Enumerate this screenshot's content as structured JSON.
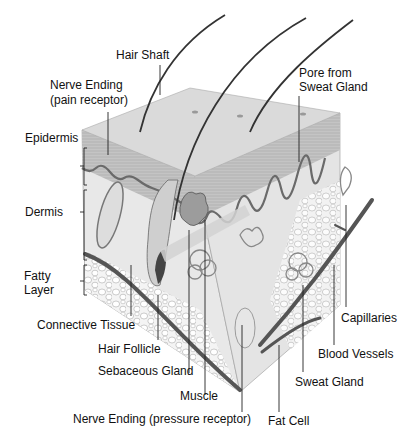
{
  "diagram": {
    "layers": [
      {
        "id": "epidermis",
        "label": "Epidermis"
      },
      {
        "id": "dermis",
        "label": "Dermis"
      },
      {
        "id": "fatty",
        "label_line1": "Fatty",
        "label_line2": "Layer"
      }
    ],
    "labels": {
      "hair_shaft": "Hair Shaft",
      "nerve_pain_line1": "Nerve Ending",
      "nerve_pain_line2": "(pain receptor)",
      "pore_line1": "Pore from",
      "pore_line2": "Sweat Gland",
      "connective_tissue": "Connective Tissue",
      "hair_follicle": "Hair Follicle",
      "sebaceous_gland": "Sebaceous Gland",
      "muscle": "Muscle",
      "nerve_pressure": "Nerve Ending (pressure receptor)",
      "fat_cell": "Fat Cell",
      "sweat_gland": "Sweat Gland",
      "blood_vessels": "Blood Vessels",
      "capillaries": "Capillaries"
    },
    "colors": {
      "background": "#ffffff",
      "skin_top": "#d9d9d9",
      "epidermis": "#b8b8b8",
      "dermis": "#e6e6e6",
      "fat": "#f2f2f2",
      "vessel": "#555555",
      "line": "#222222"
    }
  }
}
